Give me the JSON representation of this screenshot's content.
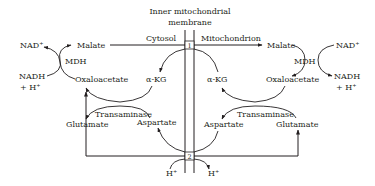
{
  "diagram": {
    "title_line1": "Inner mitochondrial",
    "title_line2": "membrane",
    "compartments": {
      "left": "Cytosol",
      "right": "Mitochondrion"
    },
    "transporters": {
      "t1": "1",
      "t2": "2"
    },
    "cytosol": {
      "nad": "NAD⁺",
      "nadh_line1": "NADH",
      "nadh_line2": "+ H⁺",
      "malate": "Malate",
      "mdh": "MDH",
      "oxaloacetate": "Oxaloacetate",
      "akg": "α-KG",
      "transaminase": "Transaminase",
      "glutamate": "Glutamate",
      "aspartate": "Aspartate",
      "proton": "H⁺"
    },
    "mitochondrion": {
      "nad": "NAD⁺",
      "nadh_line1": "NADH",
      "nadh_line2": "+ H⁺",
      "malate": "Malate",
      "mdh": "MDH",
      "oxaloacetate": "Oxaloacetate",
      "akg": "α-KG",
      "transaminase": "Transaminase",
      "glutamate": "Glutamate",
      "aspartate": "Aspartate",
      "proton": "H⁺"
    },
    "colors": {
      "ink": "#231f20",
      "background": "#ffffff"
    }
  }
}
